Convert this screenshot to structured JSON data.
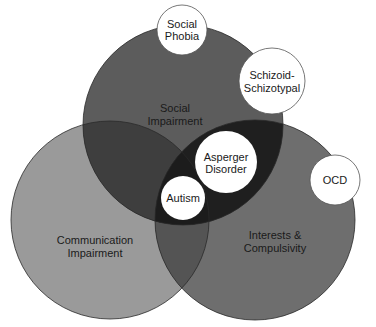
{
  "diagram": {
    "type": "venn",
    "sets": [
      {
        "id": "social",
        "line1": "Social",
        "line2": "Impairment",
        "color": "#5c5c5c"
      },
      {
        "id": "communication",
        "line1": "Communication",
        "line2": "Impairment",
        "color": "#9a9a9a"
      },
      {
        "id": "interests",
        "line1": "Interests &",
        "line2": "Compulsivity",
        "color": "#6e6e6e"
      }
    ],
    "overlaps": {
      "all_three_color": "#1c1c1c",
      "social_interests_color": "#1f1f1f",
      "social_communication_color": "#3e3e3e",
      "communication_interests_color": "#545454"
    },
    "conditions": [
      {
        "id": "social-phobia",
        "line1": "Social",
        "line2": "Phobia"
      },
      {
        "id": "schizoid",
        "line1": "Schizoid-",
        "line2": "Schizotypal"
      },
      {
        "id": "asperger",
        "line1": "Asperger",
        "line2": "Disorder"
      },
      {
        "id": "autism",
        "line1": "Autism"
      },
      {
        "id": "ocd",
        "line1": "OCD"
      }
    ]
  }
}
